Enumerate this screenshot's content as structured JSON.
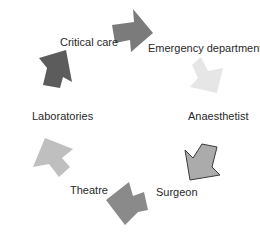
{
  "diagram": {
    "type": "cycle",
    "nodes": [
      {
        "id": "critical_care",
        "label": "Critical care"
      },
      {
        "id": "emergency_department",
        "label": "Emergency department"
      },
      {
        "id": "anaesthetist",
        "label": "Anaesthetist"
      },
      {
        "id": "surgeon",
        "label": "Surgeon"
      },
      {
        "id": "theatre",
        "label": "Theatre"
      },
      {
        "id": "laboratories",
        "label": "Laboratories"
      }
    ],
    "arrows": [
      {
        "from": "critical_care",
        "to": "emergency_department",
        "color": "#7b7b7b"
      },
      {
        "from": "emergency_department",
        "to": "anaesthetist",
        "color": "#e6e6e6"
      },
      {
        "from": "anaesthetist",
        "to": "surgeon",
        "color": "#ababab",
        "outline": "#3a3a3a"
      },
      {
        "from": "surgeon",
        "to": "theatre",
        "color": "#8a8a8a"
      },
      {
        "from": "theatre",
        "to": "laboratories",
        "color": "#bfbfbf"
      },
      {
        "from": "laboratories",
        "to": "critical_care",
        "color": "#5c5c5c"
      }
    ]
  }
}
